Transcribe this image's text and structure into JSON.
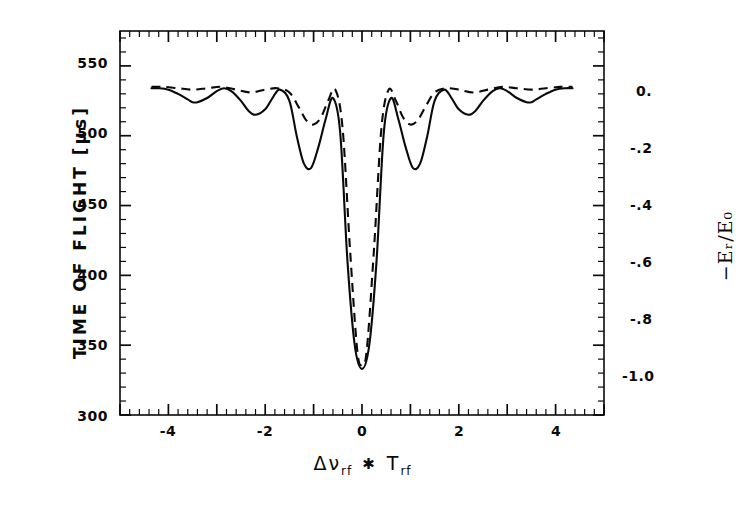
{
  "figure": {
    "background_color": "#ffffff",
    "ink_color": "#0a0a0a"
  },
  "axes": {
    "left": {
      "label": "TIME OF FLIGHT  [µs]",
      "ticks": [
        "300",
        "350",
        "400",
        "450",
        "500",
        "550"
      ],
      "tick_values": [
        300,
        350,
        400,
        450,
        500,
        550
      ],
      "limits": [
        300,
        575
      ]
    },
    "right": {
      "label": "−Eᵣ/E₀",
      "label_plain": "-E_r/E_0",
      "ticks": [
        "-1.0",
        "-.8",
        "-.6",
        "-.4",
        "-.2",
        "0."
      ],
      "tick_values": [
        -1.0,
        -0.8,
        -0.6,
        -0.4,
        -0.2,
        0.0
      ],
      "limits": [
        -1.0,
        0.0
      ]
    },
    "bottom": {
      "label_delta": "Δν",
      "label_sub1": "rf",
      "label_operator": "✱",
      "label_t": "T",
      "label_sub2": "rf",
      "label_plain": "Δν_rf ✱ T_rf",
      "ticks": [
        "-4",
        "-2",
        "0",
        "2",
        "4"
      ],
      "tick_values": [
        -4,
        -2,
        0,
        2,
        4
      ],
      "limits": [
        -5,
        5
      ]
    }
  },
  "chart_data": {
    "type": "line",
    "title": "",
    "xlabel": "Δν_rf ✱ T_rf",
    "ylabel": "TIME OF FLIGHT  [µs]",
    "ylabel_secondary": "-E_r/E_0",
    "xlim": [
      -5,
      5
    ],
    "ylim": [
      300,
      575
    ],
    "ylim_secondary": [
      -1.0,
      0.0
    ],
    "grid": false,
    "legend": false,
    "baseline_time_of_flight": 533,
    "minimum_time_of_flight": 333,
    "series": [
      {
        "name": "solid",
        "linestyle": "solid",
        "color": "#0a0a0a",
        "x_range": [
          -4.35,
          4.35
        ],
        "description": "Narrow central resonance at 0 with deep decaying sidelobes",
        "x": [
          -4.35,
          -4.2,
          -4.0,
          -3.8,
          -3.6,
          -3.5,
          -3.4,
          -3.2,
          -3.0,
          -2.85,
          -2.7,
          -2.5,
          -2.35,
          -2.2,
          -2.0,
          -1.85,
          -1.7,
          -1.5,
          -1.35,
          -1.2,
          -1.05,
          -0.9,
          -0.75,
          -0.6,
          -0.45,
          -0.3,
          -0.15,
          0.0,
          0.15,
          0.3,
          0.45,
          0.6,
          0.75,
          0.9,
          1.05,
          1.2,
          1.35,
          1.5,
          1.7,
          1.85,
          2.0,
          2.2,
          2.35,
          2.5,
          2.7,
          2.85,
          3.0,
          3.2,
          3.4,
          3.5,
          3.6,
          3.8,
          4.0,
          4.2,
          4.35
        ],
        "y": [
          534,
          534,
          533,
          530,
          526,
          524,
          524,
          527,
          532,
          534,
          532,
          525,
          518,
          515,
          519,
          527,
          533,
          525,
          500,
          480,
          477,
          492,
          512,
          527,
          502,
          410,
          350,
          333,
          350,
          410,
          502,
          527,
          512,
          492,
          477,
          480,
          500,
          525,
          533,
          527,
          519,
          515,
          518,
          525,
          532,
          534,
          532,
          527,
          524,
          524,
          526,
          530,
          533,
          534,
          534
        ]
      },
      {
        "name": "dashed",
        "linestyle": "dashed",
        "color": "#0a0a0a",
        "x_range": [
          -4.35,
          4.35
        ],
        "description": "Same central resonance, slightly narrower, with much shallower sidelobes",
        "x": [
          -4.35,
          -4.1,
          -3.8,
          -3.5,
          -3.2,
          -2.9,
          -2.6,
          -2.3,
          -2.0,
          -1.75,
          -1.5,
          -1.3,
          -1.15,
          -1.0,
          -0.85,
          -0.7,
          -0.55,
          -0.4,
          -0.25,
          -0.1,
          0.0,
          0.1,
          0.25,
          0.4,
          0.55,
          0.7,
          0.85,
          1.0,
          1.15,
          1.3,
          1.5,
          1.75,
          2.0,
          2.3,
          2.6,
          2.9,
          3.2,
          3.5,
          3.8,
          4.1,
          4.35
        ],
        "y": [
          535,
          535,
          534,
          533,
          534,
          535,
          533,
          531,
          533,
          534,
          531,
          520,
          511,
          508,
          513,
          525,
          533,
          505,
          420,
          347,
          336,
          347,
          420,
          505,
          533,
          525,
          513,
          508,
          511,
          520,
          531,
          534,
          533,
          531,
          533,
          535,
          534,
          533,
          534,
          535,
          535
        ]
      }
    ]
  }
}
